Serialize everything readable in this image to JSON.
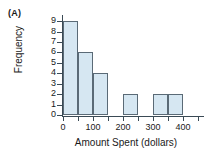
{
  "panel": {
    "label": "(A)"
  },
  "chart_data": {
    "type": "bar",
    "title": "",
    "xlabel": "Amount Spent (dollars)",
    "ylabel": "Frequency",
    "xlim": [
      -50,
      450
    ],
    "ylim": [
      0,
      9
    ],
    "bin_width": 50,
    "grid": false,
    "legend": null,
    "x_tick_labels": [
      "0",
      "100",
      "200",
      "300",
      "400"
    ],
    "x_tick_values": [
      0,
      100,
      200,
      300,
      400
    ],
    "y_tick_labels": [
      "0",
      "1",
      "2",
      "3",
      "4",
      "5",
      "6",
      "7",
      "8",
      "9"
    ],
    "y_tick_values": [
      0,
      1,
      2,
      3,
      4,
      5,
      6,
      7,
      8,
      9
    ],
    "bars": [
      {
        "bin_start": 0,
        "bin_end": 50,
        "value": 9
      },
      {
        "bin_start": 50,
        "bin_end": 100,
        "value": 6
      },
      {
        "bin_start": 100,
        "bin_end": 150,
        "value": 4
      },
      {
        "bin_start": 200,
        "bin_end": 250,
        "value": 2
      },
      {
        "bin_start": 300,
        "bin_end": 350,
        "value": 2
      },
      {
        "bin_start": 350,
        "bin_end": 400,
        "value": 2
      }
    ],
    "categories": [
      "0-50",
      "50-100",
      "100-150",
      "200-250",
      "300-350",
      "350-400"
    ],
    "values": [
      9,
      6,
      4,
      2,
      2,
      2
    ],
    "colors": {
      "bar_fill": "#d6e7f2",
      "bar_stroke": "#5a6a76",
      "axis": "#3a4a55",
      "text": "#1a1a1a",
      "background": "#ffffff"
    }
  }
}
